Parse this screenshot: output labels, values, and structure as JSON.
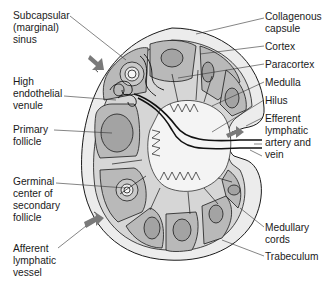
{
  "diagram": {
    "colors": {
      "capsule_fill": "#ececec",
      "cortex_fill": "#b9b9b9",
      "follicle_fill": "#a3a3a3",
      "paracortex_fill": "#e2e2e2",
      "medulla_fill": "#f2f2f2",
      "outline": "#1a1a1a",
      "arrow": "#7a7a7a"
    },
    "labels_left": [
      {
        "id": "subcapsular-sinus",
        "lines": [
          "Subcapsular",
          "(marginal)",
          "sinus"
        ]
      },
      {
        "id": "high-endothelial-venule",
        "lines": [
          "High",
          "endothelial",
          "venule"
        ]
      },
      {
        "id": "primary-follicle",
        "lines": [
          "Primary",
          "follicle"
        ]
      },
      {
        "id": "germinal-center",
        "lines": [
          "Germinal",
          "center of",
          "secondary",
          "follicle"
        ]
      },
      {
        "id": "afferent-lymphatic-vessel",
        "lines": [
          "Afferent",
          "lymphatic",
          "vessel"
        ]
      }
    ],
    "labels_right": [
      {
        "id": "collagenous-capsule",
        "lines": [
          "Collagenous",
          "capsule"
        ]
      },
      {
        "id": "cortex",
        "lines": [
          "Cortex"
        ]
      },
      {
        "id": "paracortex",
        "lines": [
          "Paracortex"
        ]
      },
      {
        "id": "medulla",
        "lines": [
          "Medulla"
        ]
      },
      {
        "id": "hilus",
        "lines": [
          "Hilus"
        ]
      },
      {
        "id": "efferent-lymphatic",
        "lines": [
          "Efferent",
          "lymphatic"
        ]
      },
      {
        "id": "artery-and-vein",
        "lines": [
          "artery and",
          "vein"
        ]
      },
      {
        "id": "medullary-cords",
        "lines": [
          "Medullary",
          "cords"
        ]
      },
      {
        "id": "trabeculum",
        "lines": [
          "Trabeculum"
        ]
      }
    ]
  }
}
